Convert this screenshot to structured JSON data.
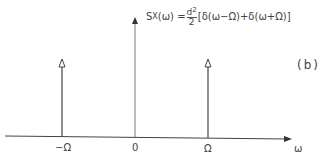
{
  "figure": {
    "panel_label": "(b)",
    "equation": {
      "lhs_symbol": "S",
      "lhs_subscript": "X",
      "lhs_arg": "(ω) =",
      "frac_num": "d",
      "frac_num_sup": "2",
      "frac_den": "2",
      "rhs": "[δ(ω−Ω)+δ(ω+Ω)]"
    },
    "axis": {
      "variable_label": "ω",
      "ticks": [
        "−Ω",
        "0",
        "Ω"
      ]
    },
    "impulses": [
      {
        "position": "−Ω",
        "relative_height": 1
      },
      {
        "position": "0",
        "relative_height": 1.55
      },
      {
        "position": "Ω",
        "relative_height": 1
      }
    ],
    "colors": {
      "line": "#444444",
      "background": "#ffffff"
    }
  }
}
